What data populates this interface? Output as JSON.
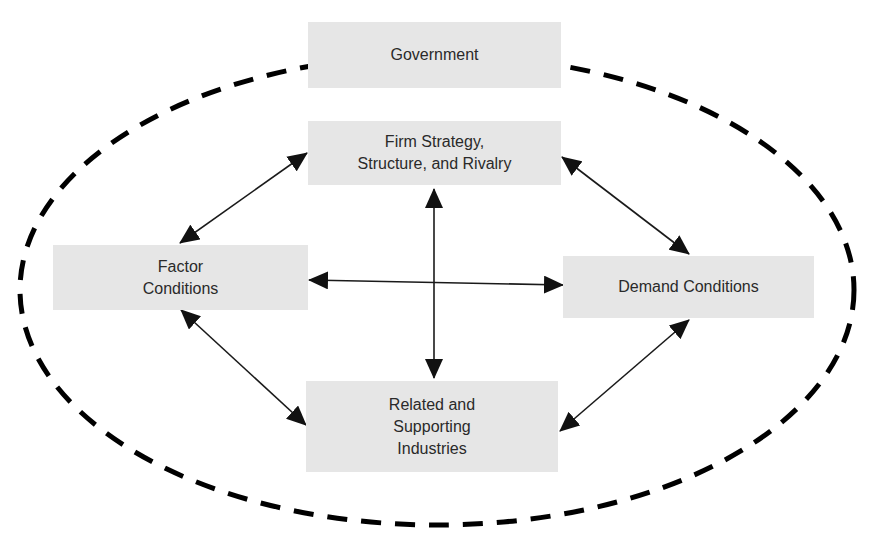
{
  "diagram": {
    "colors": {
      "box_fill": "#e6e6e6",
      "text": "#2a2a2a",
      "arrow": "#1a1a1a",
      "ellipse_dash": "#000000"
    },
    "nodes": {
      "government": {
        "label": "Government"
      },
      "firm": {
        "label": "Firm Strategy,\nStructure, and Rivalry"
      },
      "factor": {
        "label": "Factor\nConditions"
      },
      "demand": {
        "label": "Demand Conditions"
      },
      "related": {
        "label": "Related and\nSupporting\nIndustries"
      }
    },
    "edges": [
      {
        "from": "firm",
        "to": "factor",
        "type": "bidirectional"
      },
      {
        "from": "firm",
        "to": "demand",
        "type": "bidirectional"
      },
      {
        "from": "firm",
        "to": "related",
        "type": "bidirectional"
      },
      {
        "from": "factor",
        "to": "demand",
        "type": "bidirectional"
      },
      {
        "from": "factor",
        "to": "related",
        "type": "bidirectional"
      },
      {
        "from": "demand",
        "to": "related",
        "type": "bidirectional"
      }
    ],
    "enclosure": {
      "shape": "dashed-ellipse",
      "encloses": [
        "firm",
        "factor",
        "demand",
        "related"
      ],
      "boundary_label_node": "government"
    }
  }
}
